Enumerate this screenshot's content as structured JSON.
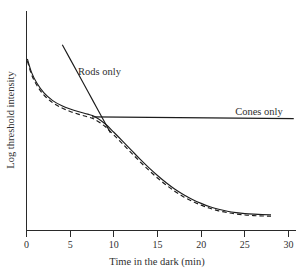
{
  "chart_data": {
    "type": "line",
    "title": "",
    "xlabel": "Time in the dark (min)",
    "ylabel": "Log threshold intensity",
    "xlim": [
      0,
      30
    ],
    "xticks": [
      0,
      5,
      10,
      15,
      20,
      25,
      30
    ],
    "xticklabels": [
      "0",
      "5",
      "10",
      "15",
      "20",
      "25",
      "30"
    ],
    "ylim": [
      0,
      1
    ],
    "yticks": [],
    "yticklabels": [],
    "grid": false,
    "legend": "inline-annotations",
    "annotations": [
      {
        "name": "rods-only-label",
        "text": "Rods only",
        "x": 5.9,
        "y": 0.79
      },
      {
        "name": "cones-only-label",
        "text": "Cones only",
        "x": 23.9,
        "y": 0.59
      }
    ],
    "series": [
      {
        "name": "Rods only",
        "style": "solid",
        "description": "Steep descending rod branch crossing the cone plateau at the rod-cone break",
        "x": [
          4.1,
          5.0,
          6.0,
          7.0,
          7.6,
          8.2,
          9.0,
          9.6
        ],
        "y": [
          0.945,
          0.872,
          0.791,
          0.71,
          0.661,
          0.612,
          0.547,
          0.498
        ]
      },
      {
        "name": "Cones only",
        "style": "solid",
        "description": "Flat cone plateau threshold extending to the right edge",
        "x": [
          7.5,
          30.6
        ],
        "y": [
          0.578,
          0.569
        ]
      },
      {
        "name": "Dark adaptation curve (measured)",
        "style": "solid",
        "description": "Overall biphasic dark adaptation curve: rapid cone limb, rod-cone break near 8 min, slow rod limb reaching absolute threshold near 25 min",
        "x": [
          0.1,
          0.6,
          1.2,
          2.0,
          3.0,
          4.0,
          5.0,
          6.0,
          7.0,
          7.8,
          9.0,
          10.0,
          11.0,
          12.0,
          13.0,
          14.0,
          15.0,
          16.0,
          17.0,
          18.0,
          19.0,
          20.0,
          21.0,
          22.0,
          23.0,
          24.0,
          25.0,
          26.0,
          27.0,
          28.0
        ],
        "y": [
          0.873,
          0.802,
          0.749,
          0.7,
          0.661,
          0.636,
          0.618,
          0.604,
          0.592,
          0.58,
          0.543,
          0.5,
          0.455,
          0.409,
          0.363,
          0.32,
          0.28,
          0.243,
          0.21,
          0.182,
          0.158,
          0.138,
          0.121,
          0.108,
          0.098,
          0.091,
          0.086,
          0.083,
          0.081,
          0.08
        ]
      },
      {
        "name": "Dark adaptation curve (fitted, dashed)",
        "style": "dashed",
        "description": "Dashed companion curve running just below the solid adaptation curve",
        "x": [
          0.1,
          0.6,
          1.2,
          2.0,
          3.0,
          4.0,
          5.0,
          6.0,
          7.0,
          7.8,
          9.0,
          10.0,
          11.0,
          12.0,
          13.0,
          14.0,
          15.0,
          16.0,
          17.0,
          18.0,
          19.0,
          20.0,
          21.0,
          22.0,
          23.0,
          24.0,
          25.0,
          26.0,
          27.0,
          28.0
        ],
        "y": [
          0.862,
          0.791,
          0.738,
          0.689,
          0.65,
          0.625,
          0.606,
          0.591,
          0.578,
          0.566,
          0.529,
          0.486,
          0.441,
          0.395,
          0.35,
          0.307,
          0.267,
          0.231,
          0.199,
          0.171,
          0.148,
          0.129,
          0.113,
          0.1,
          0.091,
          0.084,
          0.079,
          0.076,
          0.074,
          0.073
        ]
      }
    ]
  }
}
